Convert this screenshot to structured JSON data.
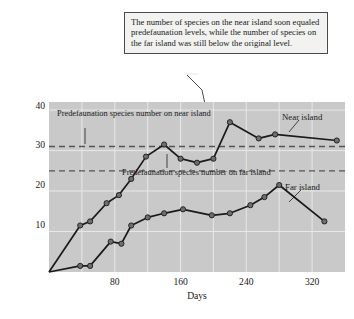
{
  "callout": {
    "text": "The number of species on the near island soon equaled predefaunation levels, while the number of species on the far island was still below the original level."
  },
  "annotations": {
    "near_line_label": "Predefaunation species number on near island",
    "far_line_label": "Predefaunation species number on far island",
    "near_series_label": "Near island",
    "far_series_label": "Far island"
  },
  "colors": {
    "plot_background": "#c9c9c9",
    "gridline": "#e8e8e8",
    "near_series": "#1a1a1a",
    "far_series": "#1a1a1a",
    "marker_fill": "#6e6e6e",
    "dashed_reference": "#555555",
    "callout_background": "#f2f2f0",
    "callout_border": "#4a4a4a"
  },
  "chart_data": {
    "type": "line",
    "title": "",
    "xlabel": "Days",
    "ylabel": "Number of species present",
    "xlim": [
      0,
      360
    ],
    "ylim": [
      0,
      42
    ],
    "xticks": [
      80,
      160,
      240,
      320
    ],
    "xticks_minor": [
      40,
      120,
      200,
      280,
      360
    ],
    "yticks": [
      10,
      20,
      30,
      40
    ],
    "grid": true,
    "legend": "inline-labels",
    "reference_lines": [
      {
        "name": "Predefaunation species number on near island",
        "value": 31,
        "style": "dashed"
      },
      {
        "name": "Predefaunation species number on far island",
        "value": 25,
        "style": "dashed"
      }
    ],
    "series": [
      {
        "name": "Near island",
        "points": [
          {
            "x": 0,
            "y": 0
          },
          {
            "x": 38,
            "y": 11.5
          },
          {
            "x": 50,
            "y": 12.5
          },
          {
            "x": 70,
            "y": 17
          },
          {
            "x": 85,
            "y": 19
          },
          {
            "x": 100,
            "y": 23
          },
          {
            "x": 118,
            "y": 28.5
          },
          {
            "x": 140,
            "y": 31.5
          },
          {
            "x": 160,
            "y": 28
          },
          {
            "x": 180,
            "y": 27
          },
          {
            "x": 200,
            "y": 28
          },
          {
            "x": 220,
            "y": 37
          },
          {
            "x": 255,
            "y": 33
          },
          {
            "x": 275,
            "y": 34
          },
          {
            "x": 350,
            "y": 32.5
          }
        ]
      },
      {
        "name": "Far island",
        "points": [
          {
            "x": 0,
            "y": 0
          },
          {
            "x": 38,
            "y": 1.5
          },
          {
            "x": 50,
            "y": 1.5
          },
          {
            "x": 75,
            "y": 7.5
          },
          {
            "x": 88,
            "y": 7
          },
          {
            "x": 100,
            "y": 11.5
          },
          {
            "x": 120,
            "y": 13.5
          },
          {
            "x": 140,
            "y": 14.5
          },
          {
            "x": 163,
            "y": 15.5
          },
          {
            "x": 198,
            "y": 14
          },
          {
            "x": 220,
            "y": 14.5
          },
          {
            "x": 245,
            "y": 16.5
          },
          {
            "x": 262,
            "y": 18.5
          },
          {
            "x": 280,
            "y": 21.5
          },
          {
            "x": 335,
            "y": 12.5
          }
        ]
      }
    ]
  }
}
